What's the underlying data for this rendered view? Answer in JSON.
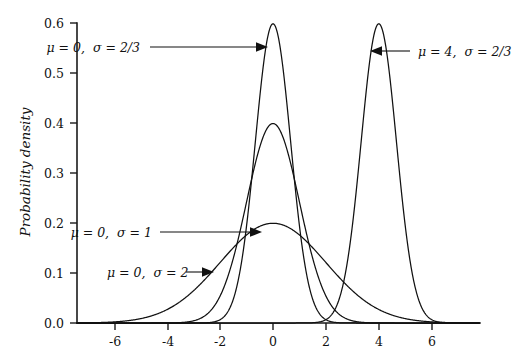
{
  "chart_data": {
    "type": "line",
    "title": "",
    "xlabel": "",
    "ylabel": "Probability density",
    "xlim": [
      -7.4,
      7.8
    ],
    "ylim": [
      0.0,
      0.625
    ],
    "grid": false,
    "legend_position": "inline-annotations",
    "x_ticks": [
      "-6",
      "-4",
      "-2",
      "0",
      "2",
      "4",
      "6"
    ],
    "x_tick_values": [
      -6,
      -4,
      -2,
      0,
      2,
      4,
      6
    ],
    "y_ticks": [
      "0.0",
      "0.1",
      "0.2",
      "0.3",
      "0.4",
      "0.5",
      "0.6"
    ],
    "y_tick_values": [
      0.0,
      0.1,
      0.2,
      0.3,
      0.4,
      0.5,
      0.6
    ],
    "series": [
      {
        "name": "mu = 0, sigma = 2/3",
        "mu": 0,
        "sigma": 0.6666666667,
        "peak_value": 0.5984,
        "peak_x": 0,
        "color": "#111111"
      },
      {
        "name": "mu = 0, sigma = 1",
        "mu": 0,
        "sigma": 1,
        "peak_value": 0.3989,
        "peak_x": 0,
        "color": "#111111"
      },
      {
        "name": "mu = 0, sigma = 2",
        "mu": 0,
        "sigma": 2,
        "peak_value": 0.1995,
        "peak_x": 0,
        "color": "#111111"
      },
      {
        "name": "mu = 4, sigma = 2/3",
        "mu": 4,
        "sigma": 0.6666666667,
        "peak_value": 0.5984,
        "peak_x": 4,
        "color": "#111111"
      }
    ]
  },
  "annotations": [
    {
      "id": "annot-sigma-two-thirds-mu0",
      "mu_text": "μ = 0,",
      "sigma_text": "σ = 2/3",
      "full_text": "μ = 0, σ = 2/3",
      "text_x": 140,
      "text_y": 52,
      "leader_from": [
        222,
        47
      ],
      "leader_to": [
        266,
        47
      ],
      "arrow_direction": "right"
    },
    {
      "id": "annot-sigma-two-thirds-mu4",
      "mu_text": "μ = 4,",
      "sigma_text": "σ = 2/3",
      "full_text": "μ = 4, σ = 2/3",
      "text_x": 418,
      "text_y": 56,
      "leader_from": [
        412,
        51
      ],
      "leader_to": [
        372,
        51
      ],
      "arrow_direction": "left"
    },
    {
      "id": "annot-sigma-one",
      "mu_text": "μ = 0,",
      "sigma_text": "σ = 1",
      "full_text": "μ = 0, σ = 1",
      "text_x": 152,
      "text_y": 237,
      "leader_from": [
        220,
        232
      ],
      "leader_to": [
        260,
        232
      ],
      "arrow_direction": "right"
    },
    {
      "id": "annot-sigma-two",
      "mu_text": "μ = 0,",
      "sigma_text": "σ = 2",
      "full_text": "μ = 0, σ = 2",
      "text_x": 107,
      "text_y": 277,
      "leader_from": [
        172,
        272
      ],
      "leader_to": [
        212,
        272
      ],
      "arrow_direction": "right"
    }
  ],
  "axes": {
    "y_axis_title": "Probability density",
    "y_axis_title_x": 30,
    "y_axis_title_y": 172
  }
}
